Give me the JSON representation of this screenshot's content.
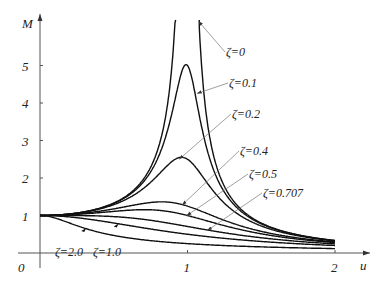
{
  "chart_data": {
    "type": "line",
    "title": "",
    "xlabel": "u",
    "ylabel": "M",
    "xlim": [
      0,
      2
    ],
    "ylim": [
      0,
      6
    ],
    "x_ticks": [
      {
        "value": 0,
        "label": "0"
      },
      {
        "value": 1,
        "label": "1"
      },
      {
        "value": 2,
        "label": "2"
      }
    ],
    "y_ticks": [
      {
        "value": 1,
        "label": "1"
      },
      {
        "value": 2,
        "label": "2"
      },
      {
        "value": 3,
        "label": "3"
      },
      {
        "value": 4,
        "label": "4"
      },
      {
        "value": 5,
        "label": "5"
      }
    ],
    "grid": false,
    "formula": "M = 1 / sqrt((1 - u^2)^2 + (2 ζ u)^2)",
    "series": [
      {
        "name": "ζ=0",
        "zeta": 0,
        "label_pos": [
          226,
          56
        ],
        "arrow_u": 1.06
      },
      {
        "name": "ζ=0.1",
        "zeta": 0.1,
        "label_pos": [
          229,
          87
        ],
        "arrow_u": 1.05
      },
      {
        "name": "ζ=0.2",
        "zeta": 0.2,
        "label_pos": [
          232,
          118
        ],
        "arrow_u": 0.93
      },
      {
        "name": "ζ=0.4",
        "zeta": 0.4,
        "label_pos": [
          240,
          155
        ],
        "arrow_u": 0.95
      },
      {
        "name": "ζ=0.5",
        "zeta": 0.5,
        "label_pos": [
          249,
          178
        ],
        "arrow_u": 0.98
      },
      {
        "name": "ζ=0.707",
        "zeta": 0.707,
        "label_pos": [
          263,
          197
        ],
        "arrow_u": 1.12
      },
      {
        "name": "ζ=1.0",
        "zeta": 1.0,
        "label_pos": [
          93,
          256
        ],
        "arrow_u": 0.52
      },
      {
        "name": "ζ=2.0",
        "zeta": 2.0,
        "label_pos": [
          55,
          256
        ],
        "arrow_u": 0.3
      }
    ],
    "sample_points": {
      "u": [
        0,
        0.5,
        1.0,
        1.5,
        2.0
      ],
      "ζ=0": [
        1.0,
        1.33,
        null,
        0.8,
        0.33
      ],
      "ζ=0.1": [
        1.0,
        1.32,
        5.0,
        0.79,
        0.33
      ],
      "ζ=0.2": [
        1.0,
        1.29,
        2.5,
        0.77,
        0.32
      ],
      "ζ=0.4": [
        1.0,
        1.19,
        1.25,
        0.7,
        0.3
      ],
      "ζ=0.5": [
        1.0,
        1.11,
        1.0,
        0.66,
        0.28
      ],
      "ζ=0.707": [
        1.0,
        0.97,
        0.71,
        0.55,
        0.24
      ],
      "ζ=1.0": [
        1.0,
        0.8,
        0.5,
        0.31,
        0.2
      ],
      "ζ=2.0": [
        1.0,
        0.49,
        0.25,
        0.2,
        0.12
      ]
    }
  }
}
